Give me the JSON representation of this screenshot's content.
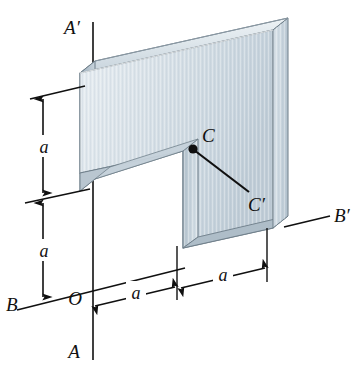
{
  "figure": {
    "type": "engineering-isometric-diagram",
    "background_color": "#ffffff",
    "line_color": "#101010",
    "plate": {
      "face_color": "#d9e2e8",
      "face_color_light": "#e9eff3",
      "top_edge_color": "#cfd9e0",
      "side_edge_color": "#b7c4cd",
      "outline_color": "#5d6e79"
    }
  },
  "labels": {
    "axis_a_top": "A′",
    "axis_a_bottom": "A",
    "axis_b_left": "B",
    "axis_b_right": "B′",
    "origin": "O",
    "centroid": "C",
    "centroid_prime": "C′",
    "dim_vertical_upper": "a",
    "dim_vertical_lower": "a",
    "dim_horizontal_left": "a",
    "dim_horizontal_right": "a"
  },
  "dimensions": {
    "vertical": [
      {
        "label": "a",
        "position": "upper-left"
      },
      {
        "label": "a",
        "position": "lower-left"
      }
    ],
    "horizontal": [
      {
        "label": "a",
        "position": "bottom-left"
      },
      {
        "label": "a",
        "position": "bottom-right"
      }
    ]
  },
  "axes": [
    {
      "name": "A-A'",
      "orientation": "vertical",
      "start_label": "A",
      "end_label": "A′"
    },
    {
      "name": "B-B'",
      "orientation": "horizontal",
      "start_label": "B",
      "end_label": "B′"
    },
    {
      "name": "C-C'",
      "orientation": "oblique",
      "start_label": "C",
      "end_label": "C′"
    }
  ],
  "points": [
    {
      "name": "O",
      "description": "origin at intersection of A-A' and B-B'"
    },
    {
      "name": "C",
      "description": "centroid marker dot on plate face"
    }
  ]
}
